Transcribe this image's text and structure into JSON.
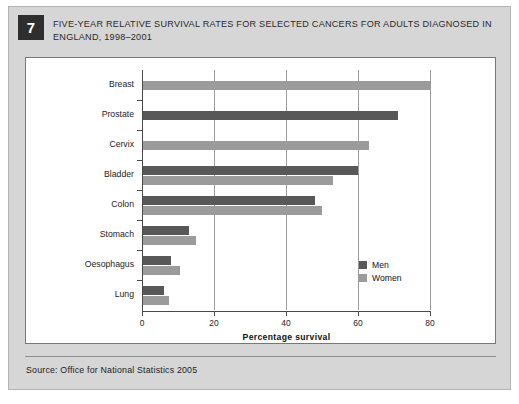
{
  "figure": {
    "number": "7",
    "title": "FIVE-YEAR RELATIVE SURVIVAL RATES FOR SELECTED CANCERS FOR ADULTS DIAGNOSED IN ENGLAND, 1998–2001",
    "source": "Source:  Office for National Statistics 2005"
  },
  "chart_data": {
    "type": "bar",
    "orientation": "horizontal",
    "title": "FIVE-YEAR RELATIVE SURVIVAL RATES FOR SELECTED CANCERS FOR ADULTS DIAGNOSED IN ENGLAND, 1998–2001",
    "xlabel": "Percentage survival",
    "ylabel": "",
    "xlim": [
      0,
      80
    ],
    "xticks": [
      0,
      20,
      40,
      60,
      80
    ],
    "xtick_labels": [
      "0",
      "20",
      "40",
      "60",
      "80"
    ],
    "grid": true,
    "legend_position": "inside-bottom-right",
    "categories": [
      "Breast",
      "Prostate",
      "Cervix",
      "Bladder",
      "Colon",
      "Stomach",
      "Oesophagus",
      "Lung"
    ],
    "series": [
      {
        "name": "Men",
        "color": "#585858",
        "values": [
          null,
          71,
          null,
          60,
          48,
          13,
          8,
          6
        ]
      },
      {
        "name": "Women",
        "color": "#9b9b9b",
        "values": [
          80,
          null,
          63,
          53,
          50,
          15,
          10.5,
          7.5
        ]
      }
    ]
  },
  "legend": {
    "items": [
      {
        "label": "Men",
        "color": "#585858"
      },
      {
        "label": "Women",
        "color": "#9b9b9b"
      }
    ]
  },
  "colors": {
    "men": "#585858",
    "women": "#9b9b9b",
    "frame_background": "#d6d6d6",
    "panel_background": "#ffffff",
    "badge_background": "#2e2e2e"
  }
}
